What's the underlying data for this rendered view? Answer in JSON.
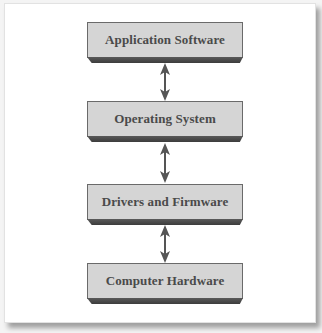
{
  "diagram": {
    "type": "layered-stack",
    "layers": [
      {
        "label": "Application Software"
      },
      {
        "label": "Operating System"
      },
      {
        "label": "Drivers and Firmware"
      },
      {
        "label": "Computer Hardware"
      }
    ],
    "connectors": [
      {
        "from": "Application Software",
        "to": "Operating System",
        "direction": "bidirectional"
      },
      {
        "from": "Operating System",
        "to": "Drivers and Firmware",
        "direction": "bidirectional"
      },
      {
        "from": "Drivers and Firmware",
        "to": "Computer Hardware",
        "direction": "bidirectional"
      }
    ],
    "colors": {
      "box_fill": "#d5d5d5",
      "box_border": "#6a6a6a",
      "box_shadow": "#444444",
      "text": "#4a4a4a",
      "arrow": "#555555"
    }
  }
}
